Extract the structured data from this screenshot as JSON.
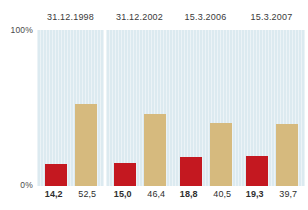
{
  "chart_data": {
    "type": "bar",
    "title": "",
    "xlabel": "",
    "ylabel": "",
    "ylim": [
      0,
      100
    ],
    "grid": false,
    "legend": "none",
    "axis_ticks": [
      "100%",
      "0%"
    ],
    "categories": [
      "31.12.1998",
      "31.12.2002",
      "15.3.2006",
      "15.3.2007"
    ],
    "series": [
      {
        "name": "red",
        "color": "#c41820",
        "values": [
          14.2,
          15.0,
          18.8,
          19.3
        ],
        "labels": [
          "14,2",
          "15,0",
          "18,8",
          "19,3"
        ]
      },
      {
        "name": "beige",
        "color": "#d6ba7e",
        "values": [
          52.5,
          46.4,
          40.5,
          39.7
        ],
        "labels": [
          "52,5",
          "46,4",
          "40,5",
          "39,7"
        ]
      }
    ],
    "panel_background": "#dceaf0"
  },
  "axis": {
    "top_label": "100%",
    "bottom_label": "0%"
  },
  "panels": [
    {
      "title": "31.12.1998",
      "red_value": 14.2,
      "red_label": "14,2",
      "beige_value": 52.5,
      "beige_label": "52,5"
    },
    {
      "title": "31.12.2002",
      "red_value": 15.0,
      "red_label": "15,0",
      "beige_value": 46.4,
      "beige_label": "46,4"
    },
    {
      "title": "15.3.2006",
      "red_value": 18.8,
      "red_label": "18,8",
      "beige_value": 40.5,
      "beige_label": "40,5"
    },
    {
      "title": "15.3.2007",
      "red_value": 19.3,
      "red_label": "19,3",
      "beige_value": 39.7,
      "beige_label": "39,7"
    }
  ]
}
